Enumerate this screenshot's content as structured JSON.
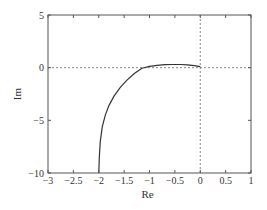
{
  "chart_data": {
    "type": "line",
    "title": "",
    "xlabel": "Re",
    "ylabel": "Im",
    "xlim": [
      -3,
      1
    ],
    "ylim": [
      -10,
      5
    ],
    "grid": false,
    "xticks": [
      -3,
      -2.5,
      -2,
      -1.5,
      -1,
      -0.5,
      0,
      0.5,
      1
    ],
    "xtick_labels": [
      "−3",
      "−2.5",
      "−2",
      "−1.5",
      "−1",
      "−0.5",
      "0",
      "0.5",
      "1"
    ],
    "yticks": [
      5,
      0,
      -5,
      -10
    ],
    "ytick_labels": [
      "5",
      "0",
      "−5",
      "−10"
    ],
    "reference_lines": [
      {
        "orientation": "horizontal",
        "value": 0,
        "style": "dashed"
      },
      {
        "orientation": "vertical",
        "value": 0,
        "style": "dashed"
      }
    ],
    "series": [
      {
        "name": "locus",
        "x": [
          -2.0,
          -1.99,
          -1.97,
          -1.93,
          -1.87,
          -1.8,
          -1.7,
          -1.58,
          -1.45,
          -1.3,
          -1.15,
          -1.0,
          -0.85,
          -0.7,
          -0.55,
          -0.4,
          -0.25,
          -0.12,
          0.0
        ],
        "y": [
          -10.0,
          -8.5,
          -7.0,
          -5.6,
          -4.5,
          -3.6,
          -2.7,
          -1.9,
          -1.2,
          -0.55,
          -0.05,
          0.12,
          0.22,
          0.28,
          0.3,
          0.3,
          0.27,
          0.2,
          0.1
        ]
      }
    ],
    "colors": {
      "line": "#333333",
      "axes": "#555555"
    }
  }
}
